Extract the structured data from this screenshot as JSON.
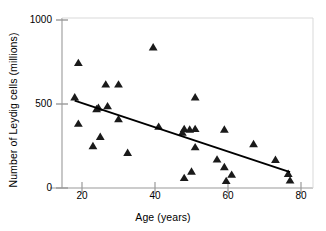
{
  "chart_data": {
    "type": "scatter",
    "title": "",
    "xlabel": "Age (years)",
    "ylabel": "Number of Leydig cells (millions)",
    "xlim": [
      16,
      82
    ],
    "ylim": [
      -20,
      1000
    ],
    "xticks": [
      20,
      40,
      60,
      80
    ],
    "yticks": [
      0,
      500,
      1000
    ],
    "grid": false,
    "legend": null,
    "marker": "triangle",
    "marker_color": "#1a1a1a",
    "series": [
      {
        "name": "Leydig cell count by age",
        "points": [
          {
            "x": 18,
            "y": 540
          },
          {
            "x": 19,
            "y": 745
          },
          {
            "x": 19,
            "y": 383
          },
          {
            "x": 23,
            "y": 250
          },
          {
            "x": 24,
            "y": 470
          },
          {
            "x": 24.5,
            "y": 478
          },
          {
            "x": 25,
            "y": 305
          },
          {
            "x": 26.5,
            "y": 617
          },
          {
            "x": 27,
            "y": 487
          },
          {
            "x": 30,
            "y": 617
          },
          {
            "x": 30,
            "y": 410
          },
          {
            "x": 32.5,
            "y": 210
          },
          {
            "x": 39.5,
            "y": 838
          },
          {
            "x": 41,
            "y": 365
          },
          {
            "x": 47.5,
            "y": 330
          },
          {
            "x": 48,
            "y": 352
          },
          {
            "x": 48,
            "y": 60
          },
          {
            "x": 49.5,
            "y": 348
          },
          {
            "x": 50,
            "y": 98
          },
          {
            "x": 51,
            "y": 540
          },
          {
            "x": 51,
            "y": 352
          },
          {
            "x": 51,
            "y": 243
          },
          {
            "x": 57,
            "y": 170
          },
          {
            "x": 59,
            "y": 348
          },
          {
            "x": 59,
            "y": 125
          },
          {
            "x": 59.5,
            "y": 42
          },
          {
            "x": 61,
            "y": 80
          },
          {
            "x": 67,
            "y": 262
          },
          {
            "x": 73,
            "y": 168
          },
          {
            "x": 76.5,
            "y": 85
          },
          {
            "x": 77,
            "y": 45
          }
        ]
      }
    ],
    "trendline": {
      "name": "linear regression",
      "x_start": 18,
      "y_start": 520,
      "x_end": 77,
      "y_end": 95,
      "color": "#000000",
      "width": 1.9
    }
  },
  "axes": {
    "x_tick_labels": [
      "20",
      "40",
      "60",
      "80"
    ],
    "y_tick_labels": [
      "0",
      "500",
      "1000"
    ],
    "x_title": "Age (years)",
    "y_title": "Number of Leydig cells (millions)"
  }
}
